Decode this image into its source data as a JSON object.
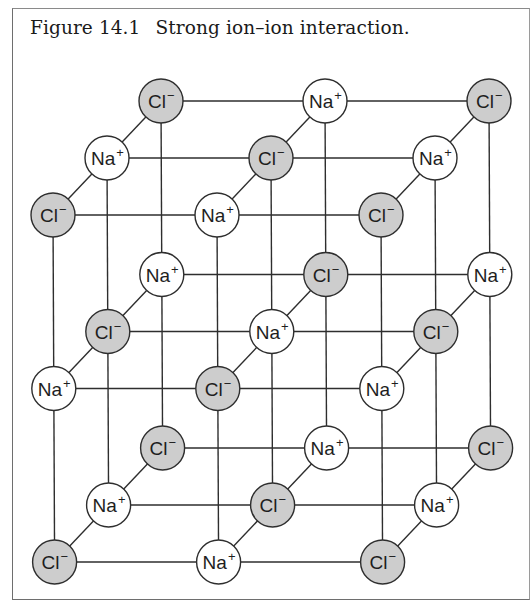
{
  "figure": {
    "label": "Figure 14.1",
    "title": "Strong ion–ion interaction."
  },
  "colors": {
    "cation_fill": "#ffffff",
    "anion_fill": "#cdcdcd",
    "line": "#2e2e2e",
    "frame": "#6e6e6e"
  },
  "ions": {
    "cation": {
      "symbol": "Na",
      "charge": "+"
    },
    "anion": {
      "symbol": "Cl",
      "charge": "−"
    }
  },
  "lattice": {
    "description": "3x3x3 NaCl crystal lattice, alternating Na+ and Cl- ions",
    "layers": [
      {
        "name": "top",
        "rows": [
          [
            "anion",
            "cation",
            "anion"
          ],
          [
            "cation",
            "anion",
            "cation"
          ],
          [
            "anion",
            "cation",
            "anion"
          ]
        ]
      },
      {
        "name": "middle",
        "rows": [
          [
            "cation",
            "anion",
            "cation"
          ],
          [
            "anion",
            "cation",
            "anion"
          ],
          [
            "cation",
            "anion",
            "cation"
          ]
        ]
      },
      {
        "name": "bottom",
        "rows": [
          [
            "anion",
            "cation",
            "anion"
          ],
          [
            "cation",
            "anion",
            "cation"
          ],
          [
            "anion",
            "cation",
            "anion"
          ]
        ]
      }
    ]
  }
}
